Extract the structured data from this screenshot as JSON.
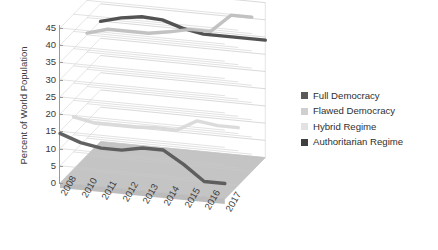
{
  "chart_data": {
    "type": "line",
    "title": "",
    "subtitle": "",
    "xlabel": "",
    "ylabel": "Percent of World Population",
    "categories": [
      "2008",
      "2010",
      "2011",
      "2012",
      "2013",
      "2014",
      "2015",
      "2016",
      "2017"
    ],
    "ylim": [
      0,
      45
    ],
    "ytick_step": 5,
    "yticks": [
      "45",
      "40",
      "35",
      "30",
      "25",
      "20",
      "15",
      "10",
      "5",
      "0"
    ],
    "grid": true,
    "three_d": true,
    "legend_position": "right",
    "series": [
      {
        "name": "Full Democracy",
        "color": "#595959",
        "values": [
          14.4,
          12.3,
          11.3,
          11.3,
          12.5,
          12.5,
          8.9,
          4.5,
          4.5
        ]
      },
      {
        "name": "Flawed Democracy",
        "color": "#bfbfbf",
        "values": [
          35.5,
          37.2,
          37.2,
          37.2,
          38.2,
          39.5,
          39.5,
          44.8,
          44.8
        ]
      },
      {
        "name": "Hybrid Regime",
        "color": "#d9d9d9",
        "values": [
          15.2,
          14.0,
          14.0,
          14.0,
          14.4,
          14.2,
          17.5,
          16.7,
          16.7
        ]
      },
      {
        "name": "Authoritarian Regime",
        "color": "#4a4a4a",
        "values": [
          34.9,
          36.5,
          37.4,
          37.1,
          35.2,
          34.1,
          34.1,
          34.1,
          34.1
        ]
      }
    ]
  },
  "legend": {
    "items": [
      {
        "label": "Full Democracy",
        "color": "#595959"
      },
      {
        "label": "Flawed Democracy",
        "color": "#cfcfcf"
      },
      {
        "label": "Hybrid Regime",
        "color": "#e2e2e2"
      },
      {
        "label": "Authoritarian Regime",
        "color": "#3f3f3f"
      }
    ]
  },
  "axes": {
    "y_title": "Percent of World Population"
  }
}
